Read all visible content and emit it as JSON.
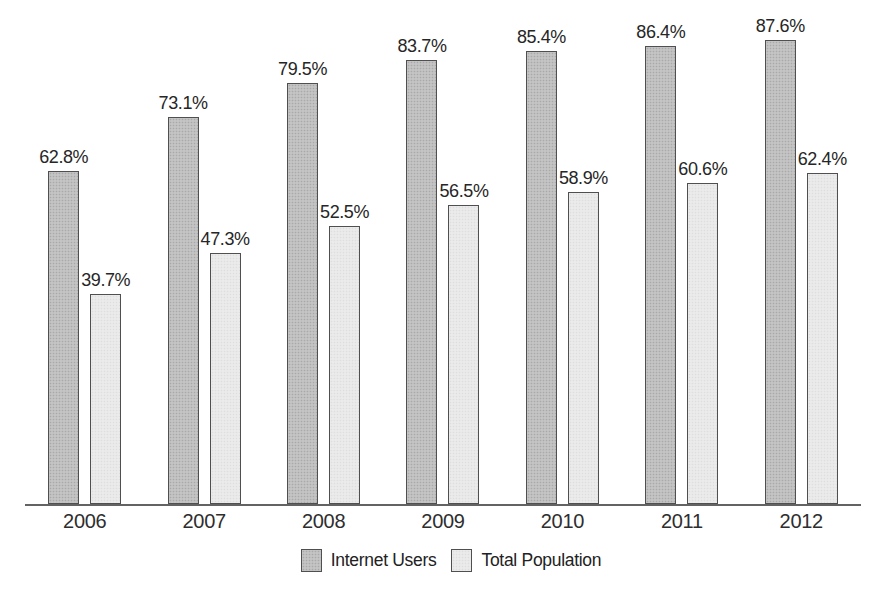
{
  "chart_data": {
    "type": "bar",
    "title": "",
    "categories": [
      "2006",
      "2007",
      "2008",
      "2009",
      "2010",
      "2011",
      "2012"
    ],
    "series": [
      {
        "name": "Internet Users",
        "values": [
          62.8,
          73.1,
          79.5,
          83.7,
          85.4,
          86.4,
          87.6
        ],
        "color": "#c4c4c4"
      },
      {
        "name": "Total Population",
        "values": [
          39.7,
          47.3,
          52.5,
          56.5,
          58.9,
          60.6,
          62.4
        ],
        "color": "#ebebeb"
      }
    ],
    "data_labels": {
      "Internet Users": [
        "62.8%",
        "73.1%",
        "79.5%",
        "83.7%",
        "85.4%",
        "86.4%",
        "87.6%"
      ],
      "Total Population": [
        "39.7%",
        "47.3%",
        "52.5%",
        "56.5%",
        "58.9%",
        "60.6%",
        "62.4%"
      ]
    },
    "value_suffix": "%",
    "xlabel": "",
    "ylabel": "",
    "ylim": [
      0,
      95
    ],
    "grid": false,
    "y_axis_shown": false,
    "legend_position": "bottom",
    "bar_border_color": "#4f4f4f",
    "axis_color": "#636363",
    "label_color": "#262626"
  },
  "legend": {
    "items": [
      {
        "label": "Internet Users",
        "swatch_color": "#c4c4c4"
      },
      {
        "label": "Total Population",
        "swatch_color": "#ebebeb"
      }
    ]
  }
}
